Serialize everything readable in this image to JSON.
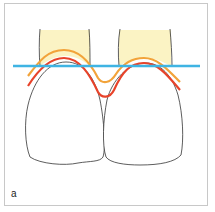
{
  "figure": {
    "panel_label": "a",
    "colors": {
      "root_fill": "#fbf3c4",
      "tooth_outline": "#333333",
      "orange_line": "#f2a33a",
      "red_line": "#e8432a",
      "blue_line": "#3fb4e3",
      "frame_border": "#c8c8c8"
    }
  }
}
